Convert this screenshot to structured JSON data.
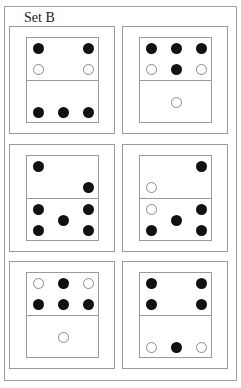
{
  "title": "Set B",
  "colors": {
    "line": "#9a9a9a",
    "black_dot": "#111111",
    "white_dot_border": "#888888"
  },
  "grid": {
    "col_left": [
      9,
      122
    ],
    "row_top": [
      26,
      144,
      261
    ]
  },
  "cards": [
    {
      "id": 1,
      "row": 0,
      "col": 0,
      "top": [
        {
          "c": 0,
          "r": 0,
          "color": "black"
        },
        {
          "c": 2,
          "r": 0,
          "color": "black"
        },
        {
          "c": 0,
          "r": 2,
          "color": "white"
        },
        {
          "c": 2,
          "r": 2,
          "color": "white"
        }
      ],
      "bottom": [
        {
          "c": 0,
          "r": 2,
          "color": "black"
        },
        {
          "c": 1,
          "r": 2,
          "color": "black"
        },
        {
          "c": 2,
          "r": 2,
          "color": "black"
        }
      ]
    },
    {
      "id": 2,
      "row": 0,
      "col": 1,
      "top": [
        {
          "c": 0,
          "r": 0,
          "color": "black"
        },
        {
          "c": 1,
          "r": 0,
          "color": "black"
        },
        {
          "c": 2,
          "r": 0,
          "color": "black"
        },
        {
          "c": 0,
          "r": 2,
          "color": "white"
        },
        {
          "c": 1,
          "r": 2,
          "color": "black"
        },
        {
          "c": 2,
          "r": 2,
          "color": "white"
        }
      ],
      "bottom": [
        {
          "c": 1,
          "r": 1,
          "color": "white"
        }
      ]
    },
    {
      "id": 3,
      "row": 1,
      "col": 0,
      "top": [
        {
          "c": 0,
          "r": 0,
          "color": "black"
        },
        {
          "c": 2,
          "r": 2,
          "color": "black"
        }
      ],
      "bottom": [
        {
          "c": 0,
          "r": 0,
          "color": "black"
        },
        {
          "c": 2,
          "r": 0,
          "color": "black"
        },
        {
          "c": 1,
          "r": 1,
          "color": "black"
        },
        {
          "c": 0,
          "r": 2,
          "color": "black"
        },
        {
          "c": 2,
          "r": 2,
          "color": "black"
        }
      ]
    },
    {
      "id": 4,
      "row": 1,
      "col": 1,
      "top": [
        {
          "c": 2,
          "r": 0,
          "color": "black"
        },
        {
          "c": 0,
          "r": 2,
          "color": "white"
        }
      ],
      "bottom": [
        {
          "c": 0,
          "r": 0,
          "color": "white"
        },
        {
          "c": 2,
          "r": 0,
          "color": "black"
        },
        {
          "c": 1,
          "r": 1,
          "color": "black"
        },
        {
          "c": 0,
          "r": 2,
          "color": "black"
        },
        {
          "c": 2,
          "r": 2,
          "color": "black"
        }
      ]
    },
    {
      "id": 5,
      "row": 2,
      "col": 0,
      "top": [
        {
          "c": 0,
          "r": 0,
          "color": "white"
        },
        {
          "c": 1,
          "r": 0,
          "color": "black"
        },
        {
          "c": 2,
          "r": 0,
          "color": "white"
        },
        {
          "c": 0,
          "r": 2,
          "color": "black"
        },
        {
          "c": 1,
          "r": 2,
          "color": "black"
        },
        {
          "c": 2,
          "r": 2,
          "color": "black"
        }
      ],
      "bottom": [
        {
          "c": 1,
          "r": 1,
          "color": "white"
        }
      ]
    },
    {
      "id": 6,
      "row": 2,
      "col": 1,
      "top": [
        {
          "c": 0,
          "r": 0,
          "color": "black"
        },
        {
          "c": 2,
          "r": 0,
          "color": "black"
        },
        {
          "c": 0,
          "r": 2,
          "color": "black"
        },
        {
          "c": 2,
          "r": 2,
          "color": "black"
        }
      ],
      "bottom": [
        {
          "c": 0,
          "r": 2,
          "color": "white"
        },
        {
          "c": 1,
          "r": 2,
          "color": "black"
        },
        {
          "c": 2,
          "r": 2,
          "color": "white"
        }
      ]
    }
  ]
}
